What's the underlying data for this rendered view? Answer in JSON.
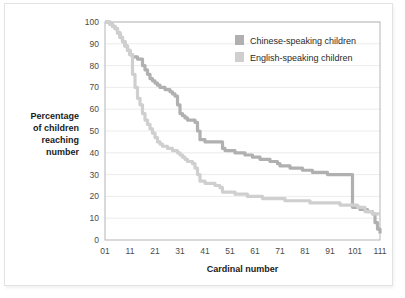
{
  "chart_data": {
    "type": "line",
    "title": "",
    "subtitle": "",
    "xlabel": "Cardinal number",
    "ylabel": "Percentage of children reaching number",
    "ylabel_lines": [
      "Percentage",
      "of children",
      "reaching",
      "number"
    ],
    "xlim": [
      1,
      111
    ],
    "ylim": [
      0,
      100
    ],
    "xticks": [
      "01",
      "11",
      "21",
      "31",
      "41",
      "51",
      "61",
      "71",
      "81",
      "91",
      "101",
      "111"
    ],
    "xtick_values": [
      1,
      11,
      21,
      31,
      41,
      51,
      61,
      71,
      81,
      91,
      101,
      111
    ],
    "yticks": [
      "0",
      "10",
      "20",
      "30",
      "40",
      "50",
      "60",
      "70",
      "80",
      "90",
      "100"
    ],
    "ytick_values": [
      0,
      10,
      20,
      30,
      40,
      50,
      60,
      70,
      80,
      90,
      100
    ],
    "grid": "horizontal",
    "legend_position": "top-right",
    "step_style": "post",
    "colors": {
      "chinese": "#b0b0b0",
      "english": "#cfcfcf",
      "grid": "#ececec",
      "frame": "#b5b5b5",
      "text": "#2b2b2b",
      "card_background": "#ffffff",
      "card_border": "#e3e3e3"
    },
    "series": [
      {
        "name": "Chinese-speaking children",
        "color_key": "chinese",
        "x": [
          1,
          2,
          3,
          4,
          5,
          6,
          7,
          8,
          9,
          10,
          11,
          12,
          13,
          14,
          15,
          16,
          17,
          18,
          19,
          20,
          21,
          22,
          23,
          24,
          25,
          26,
          27,
          28,
          29,
          30,
          31,
          32,
          33,
          34,
          35,
          36,
          37,
          38,
          39,
          40,
          41,
          42,
          43,
          44,
          45,
          46,
          47,
          48,
          49,
          50,
          51,
          52,
          53,
          54,
          55,
          56,
          57,
          58,
          59,
          60,
          61,
          62,
          63,
          64,
          65,
          66,
          67,
          68,
          69,
          70,
          71,
          72,
          73,
          74,
          75,
          76,
          77,
          78,
          79,
          80,
          81,
          82,
          83,
          84,
          85,
          86,
          87,
          88,
          89,
          90,
          91,
          92,
          93,
          94,
          95,
          96,
          97,
          98,
          99,
          100,
          101,
          102,
          103,
          104,
          105,
          106,
          107,
          108,
          109,
          110,
          111
        ],
        "values": [
          100,
          100,
          99,
          98,
          97,
          95,
          93,
          91,
          89,
          87,
          85,
          84,
          84,
          83,
          83,
          80,
          78,
          76,
          74,
          73,
          72,
          71,
          70,
          70,
          69,
          69,
          68,
          67,
          66,
          62,
          58,
          57,
          56,
          55,
          55,
          55,
          54,
          50,
          46,
          46,
          45,
          45,
          45,
          45,
          45,
          45,
          45,
          42,
          41,
          41,
          41,
          41,
          40,
          40,
          40,
          40,
          39,
          39,
          39,
          38,
          38,
          38,
          37,
          37,
          37,
          37,
          36,
          36,
          36,
          35,
          34,
          34,
          34,
          34,
          33,
          33,
          33,
          33,
          33,
          32,
          32,
          32,
          32,
          31,
          31,
          31,
          31,
          31,
          31,
          30,
          30,
          30,
          30,
          30,
          30,
          30,
          30,
          30,
          30,
          15,
          15,
          15,
          14,
          14,
          14,
          13,
          13,
          12,
          8,
          5,
          3
        ]
      },
      {
        "name": "English-speaking children",
        "color_key": "english",
        "x": [
          1,
          2,
          3,
          4,
          5,
          6,
          7,
          8,
          9,
          10,
          11,
          12,
          13,
          14,
          15,
          16,
          17,
          18,
          19,
          20,
          21,
          22,
          23,
          24,
          25,
          26,
          27,
          28,
          29,
          30,
          31,
          32,
          33,
          34,
          35,
          36,
          37,
          38,
          39,
          40,
          41,
          42,
          43,
          44,
          45,
          46,
          47,
          48,
          49,
          50,
          51,
          52,
          53,
          54,
          55,
          56,
          57,
          58,
          59,
          60,
          61,
          62,
          63,
          64,
          65,
          66,
          67,
          68,
          69,
          70,
          71,
          72,
          73,
          74,
          75,
          76,
          77,
          78,
          79,
          80,
          81,
          82,
          83,
          84,
          85,
          86,
          87,
          88,
          89,
          90,
          91,
          92,
          93,
          94,
          95,
          96,
          97,
          98,
          99,
          100,
          101,
          102,
          103,
          104,
          105,
          106,
          107,
          108,
          109,
          110,
          111
        ],
        "values": [
          100,
          100,
          99,
          98,
          97,
          95,
          93,
          91,
          89,
          87,
          85,
          76,
          70,
          65,
          62,
          58,
          55,
          53,
          51,
          49,
          47,
          45,
          44,
          43,
          43,
          42,
          42,
          41,
          41,
          40,
          39,
          38,
          37,
          36,
          36,
          35,
          33,
          30,
          27,
          27,
          26,
          26,
          26,
          26,
          25,
          25,
          24,
          22,
          22,
          22,
          22,
          22,
          21,
          21,
          21,
          21,
          21,
          20,
          20,
          20,
          20,
          20,
          20,
          19,
          19,
          19,
          19,
          19,
          19,
          19,
          19,
          19,
          18,
          18,
          18,
          18,
          18,
          18,
          18,
          18,
          18,
          18,
          17,
          17,
          17,
          17,
          17,
          17,
          17,
          17,
          17,
          17,
          17,
          17,
          16,
          16,
          16,
          16,
          16,
          16,
          16,
          15,
          15,
          15,
          13,
          13,
          13,
          12,
          12,
          12,
          12
        ]
      }
    ],
    "legend": [
      {
        "label": "Chinese-speaking children",
        "color_key": "chinese"
      },
      {
        "label": "English-speaking children",
        "color_key": "english"
      }
    ]
  }
}
